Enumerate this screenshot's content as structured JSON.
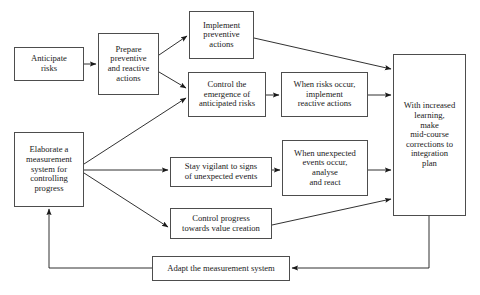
{
  "diagram": {
    "type": "flowchart",
    "canvas": {
      "width": 480,
      "height": 295
    },
    "style": {
      "box_border_color": "#4d4d4d",
      "box_fill_color": "#ffffff",
      "arrow_color": "#1a1a1a",
      "text_color": "#1a1a1a",
      "background_color": "#ffffff"
    },
    "nodes": [
      {
        "id": "anticipate-risks",
        "label": "Anticipate\nrisks",
        "x": 14,
        "y": 47,
        "w": 70,
        "h": 34,
        "font_size": 8.6
      },
      {
        "id": "prepare-preventive-and-reactive-actions",
        "label": "Prepare\npreventive\nand reactive\nactions",
        "x": 98,
        "y": 33,
        "w": 61,
        "h": 62,
        "font_size": 8.6
      },
      {
        "id": "implement-preventive-actions",
        "label": "Implement\npreventive\nactions",
        "x": 189,
        "y": 11,
        "w": 65,
        "h": 48,
        "font_size": 8.6
      },
      {
        "id": "control-emergence-of-anticipated-risks",
        "label": "Control the\nemergence of\nanticipated risks",
        "x": 188,
        "y": 72,
        "w": 78,
        "h": 45,
        "font_size": 8.6
      },
      {
        "id": "when-risks-occur-implement-reactive-actions",
        "label": "When risks occur,\nimplement\nreactive actions",
        "x": 281,
        "y": 72,
        "w": 87,
        "h": 45,
        "font_size": 8.6
      },
      {
        "id": "with-increased-learning-make-mid-course-corrections",
        "label": "With increased\nlearning,\nmake\nmid-course\ncorrections to\nintegration\nplan",
        "x": 393,
        "y": 54,
        "w": 73,
        "h": 162,
        "font_size": 8.6
      },
      {
        "id": "elaborate-a-measurement-system",
        "label": "Elaborate a\nmeasurement\nsystem for\ncontrolling\nprogress",
        "x": 14,
        "y": 132,
        "w": 70,
        "h": 75,
        "font_size": 8.6
      },
      {
        "id": "stay-vigilant-to-signs-of-unexpected-events",
        "label": "Stay vigilant to signs\nof unexpected events",
        "x": 170,
        "y": 157,
        "w": 102,
        "h": 30,
        "font_size": 8.6
      },
      {
        "id": "when-unexpected-events-occur-analyse-and-react",
        "label": "When unexpected\nevents occur,\nanalyse\nand react",
        "x": 282,
        "y": 140,
        "w": 86,
        "h": 56,
        "font_size": 8.6
      },
      {
        "id": "control-progress-towards-value-creation",
        "label": "Control progress\ntowards value creation",
        "x": 170,
        "y": 208,
        "w": 102,
        "h": 31,
        "font_size": 8.6
      },
      {
        "id": "adapt-the-measurement-system",
        "label": "Adapt the measurement system",
        "x": 152,
        "y": 256,
        "w": 138,
        "h": 25,
        "font_size": 8.6
      }
    ],
    "edges": [
      {
        "id": "e1",
        "from": "anticipate-risks",
        "to": "prepare-preventive-and-reactive-actions",
        "points": "84,64 96,64"
      },
      {
        "id": "e2",
        "from": "prepare-preventive-and-reactive-actions",
        "to": "implement-preventive-actions",
        "points": "159,55 187,36"
      },
      {
        "id": "e3",
        "from": "prepare-preventive-and-reactive-actions",
        "to": "control-emergence-of-anticipated-risks",
        "points": "159,72 186,88"
      },
      {
        "id": "e4",
        "from": "implement-preventive-actions",
        "to": "with-increased-learning-make-mid-course-corrections",
        "points": "254,38 391,69"
      },
      {
        "id": "e5",
        "from": "control-emergence-of-anticipated-risks",
        "to": "when-risks-occur-implement-reactive-actions",
        "points": "266,95 279,95"
      },
      {
        "id": "e6",
        "from": "when-risks-occur-implement-reactive-actions",
        "to": "with-increased-learning-make-mid-course-corrections",
        "points": "368,95 391,95"
      },
      {
        "id": "e7",
        "from": "elaborate-a-measurement-system",
        "to": "control-emergence-of-anticipated-risks",
        "points": "84,164 186,98"
      },
      {
        "id": "e8",
        "from": "elaborate-a-measurement-system",
        "to": "stay-vigilant-to-signs-of-unexpected-events",
        "points": "84,170 168,170"
      },
      {
        "id": "e9",
        "from": "elaborate-a-measurement-system",
        "to": "control-progress-towards-value-creation",
        "points": "84,173 168,227"
      },
      {
        "id": "e10",
        "from": "stay-vigilant-to-signs-of-unexpected-events",
        "to": "when-unexpected-events-occur-analyse-and-react",
        "points": "272,170 280,170"
      },
      {
        "id": "e11",
        "from": "when-unexpected-events-occur-analyse-and-react",
        "to": "with-increased-learning-make-mid-course-corrections",
        "points": "368,170 391,170"
      },
      {
        "id": "e12",
        "from": "control-progress-towards-value-creation",
        "to": "with-increased-learning-make-mid-course-corrections",
        "points": "272,225 391,199"
      },
      {
        "id": "e13",
        "from": "with-increased-learning-make-mid-course-corrections",
        "to": "adapt-the-measurement-system",
        "points": "429,216 429,268 292,268"
      },
      {
        "id": "e14",
        "from": "adapt-the-measurement-system",
        "to": "elaborate-a-measurement-system",
        "points": "152,268 49,268 49,209"
      }
    ]
  }
}
